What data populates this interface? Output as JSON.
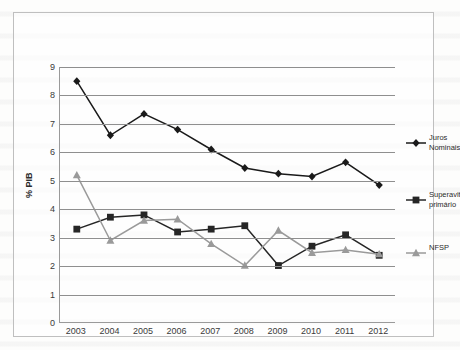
{
  "chart_data": {
    "type": "line",
    "title": "",
    "xlabel": "",
    "ylabel": "% PIB",
    "ylim": [
      0,
      9
    ],
    "ytick_step": 1,
    "grid": true,
    "legend_position": "right",
    "categories": [
      "2003",
      "2004",
      "2005",
      "2006",
      "2007",
      "2008",
      "2009",
      "2010",
      "2011",
      "2012"
    ],
    "yticks": [
      "0",
      "1",
      "2",
      "3",
      "4",
      "5",
      "6",
      "7",
      "8",
      "9"
    ],
    "series": [
      {
        "name": "Juros Nominais",
        "legend_label": "Juros\nNominais",
        "marker": "diamond",
        "color": "#1a1a1a",
        "values": [
          8.5,
          6.6,
          7.35,
          6.8,
          6.1,
          5.45,
          5.25,
          5.15,
          5.65,
          4.85
        ]
      },
      {
        "name": "Superavit primário",
        "legend_label": "Superavit\nprimário",
        "marker": "square",
        "color": "#262626",
        "values": [
          3.3,
          3.72,
          3.8,
          3.2,
          3.3,
          3.42,
          2.02,
          2.7,
          3.1,
          2.38
        ]
      },
      {
        "name": "NFSP",
        "legend_label": "NFSP",
        "marker": "triangle",
        "color": "#9a9a9a",
        "values": [
          5.2,
          2.9,
          3.6,
          3.65,
          2.78,
          2.02,
          3.25,
          2.47,
          2.57,
          2.42
        ]
      }
    ]
  },
  "axes": {
    "y_title": "% PIB"
  }
}
